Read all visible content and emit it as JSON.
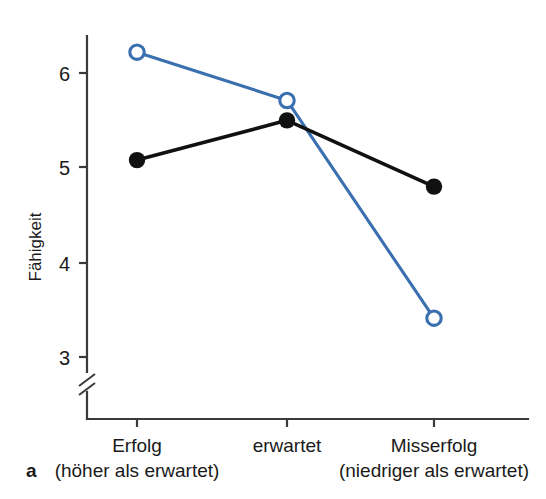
{
  "figure": {
    "panel_label": "a",
    "accent_blue": "#3a6fb0",
    "accent_black": "#111111",
    "axis_color": "#3a3a3a"
  },
  "chart_data": {
    "type": "line",
    "title": "",
    "subtitle": "",
    "xlabel": "",
    "ylabel": "Fähigkeit",
    "categories": [
      "Erfolg",
      "erwartet",
      "Misserfolg"
    ],
    "category_sublabels": [
      "(höher als erwartet)",
      "",
      "(niedriger als erwartet)"
    ],
    "yticks": [
      3,
      4,
      5,
      6
    ],
    "ytick_labels": [
      "3",
      "4",
      "5",
      "6"
    ],
    "ylim": [
      2.62,
      6.45
    ],
    "axis_break": true,
    "axis_break_note": "y-axis broken below 3",
    "grid": false,
    "legend": "none",
    "series": [
      {
        "name": "blue-open-circle-series",
        "color": "#3a6fb0",
        "marker": "open-circle",
        "values": [
          6.22,
          5.71,
          3.41
        ]
      },
      {
        "name": "black-filled-circle-series",
        "color": "#111111",
        "marker": "filled-circle",
        "values": [
          5.08,
          5.5,
          4.8
        ]
      }
    ]
  }
}
